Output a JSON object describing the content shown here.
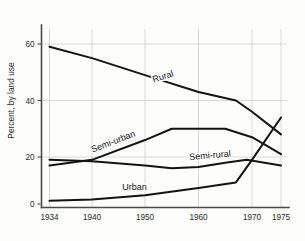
{
  "chart_data": {
    "type": "line",
    "title": "",
    "xlabel": "",
    "ylabel": "Percent, by land use",
    "xlim": [
      1934,
      1975
    ],
    "ylim": [
      0,
      68
    ],
    "grid": true,
    "legend_position": "inline-labels",
    "x_ticks": [
      "1934",
      "1940",
      "1950",
      "1960",
      "1970",
      "1975"
    ],
    "x_tick_values": [
      1934,
      1940,
      1950,
      1960,
      1970,
      1975
    ],
    "y_ticks": [
      "20",
      "40",
      "60"
    ],
    "y_tick_values": [
      20,
      40,
      60
    ],
    "y_axis_origin_tick": "0",
    "series": [
      {
        "name": "Rural",
        "label": "Rural",
        "x": [
          1934,
          1940,
          1950,
          1960,
          1967,
          1970,
          1975
        ],
        "values": [
          59,
          55,
          49,
          43,
          40,
          36,
          28
        ]
      },
      {
        "name": "Semi-urban",
        "label": "Semi-urban",
        "x": [
          1934,
          1940,
          1950,
          1955,
          1960,
          1965,
          1970,
          1975
        ],
        "values": [
          17,
          19,
          26,
          30,
          30,
          30,
          27,
          21
        ]
      },
      {
        "name": "Semi-rural",
        "label": "Semi-rural",
        "x": [
          1934,
          1940,
          1950,
          1955,
          1960,
          1965,
          1969,
          1975
        ],
        "values": [
          19,
          18.5,
          17,
          16,
          16.5,
          18,
          19,
          17
        ]
      },
      {
        "name": "Urban",
        "label": "Urban",
        "x": [
          1934,
          1940,
          1950,
          1960,
          1967,
          1970,
          1975
        ],
        "values": [
          4.5,
          5,
          6.5,
          9,
          11,
          19,
          34
        ]
      }
    ],
    "series_labels": [
      {
        "text": "Rural",
        "x": 1953.5,
        "y": 47.5,
        "rotation": -17
      },
      {
        "text": "Semi-urban",
        "x": 1944.2,
        "y": 24.5,
        "rotation": -21
      },
      {
        "text": "Semi-rural",
        "x": 1962.2,
        "y": 19.6,
        "rotation": -5
      },
      {
        "text": "Urban",
        "x": 1948.0,
        "y": 8.4,
        "rotation": 0
      }
    ]
  }
}
